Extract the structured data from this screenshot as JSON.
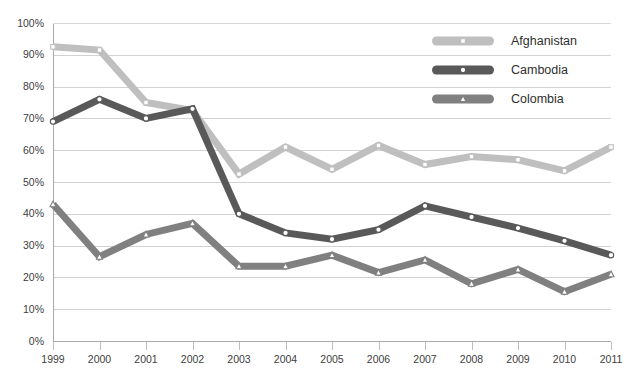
{
  "chart_data": {
    "type": "line",
    "title": "",
    "subtitle": "",
    "xlabel": "",
    "ylabel": "",
    "x": [
      "1999",
      "2000",
      "2001",
      "2002",
      "2003",
      "2004",
      "2005",
      "2006",
      "2007",
      "2008",
      "2009",
      "2010",
      "2011"
    ],
    "categories": [
      "1999",
      "2000",
      "2001",
      "2002",
      "2003",
      "2004",
      "2005",
      "2006",
      "2007",
      "2008",
      "2009",
      "2010",
      "2011"
    ],
    "ylim": [
      0,
      100
    ],
    "y_tick_labels": [
      "0%",
      "10%",
      "20%",
      "30%",
      "40%",
      "50%",
      "60%",
      "70%",
      "80%",
      "90%",
      "100%"
    ],
    "y_tick_values": [
      0,
      10,
      20,
      30,
      40,
      50,
      60,
      70,
      80,
      90,
      100
    ],
    "x_tick_labels": [
      "1999",
      "2000",
      "2001",
      "2002",
      "2003",
      "2004",
      "2005",
      "2006",
      "2007",
      "2008",
      "2009",
      "2010",
      "2011"
    ],
    "grid": "horizontal",
    "legend_position": "top-right",
    "units": "percent",
    "series": [
      {
        "name": "Afghanistan",
        "color": "#bfbfbf",
        "marker": "square",
        "marker_fill": "#ffffff",
        "values": [
          92.5,
          91.5,
          75,
          72.5,
          52.5,
          61,
          54,
          61.5,
          55.5,
          58,
          57,
          53.5,
          61
        ]
      },
      {
        "name": "Cambodia",
        "color": "#595959",
        "marker": "circle",
        "marker_fill": "#ffffff",
        "values": [
          69,
          76,
          70,
          73,
          40,
          34,
          32,
          35,
          42.5,
          39,
          35.5,
          31.5,
          27
        ]
      },
      {
        "name": "Colombia",
        "color": "#808080",
        "marker": "triangle",
        "marker_fill": "#ffffff",
        "values": [
          43,
          26.5,
          33.5,
          37,
          23.5,
          23.5,
          27,
          21.5,
          25.5,
          18,
          22.5,
          15.5,
          21
        ]
      }
    ]
  },
  "legend": {
    "entries": [
      {
        "label": "Afghanistan"
      },
      {
        "label": "Cambodia"
      },
      {
        "label": "Colombia"
      }
    ]
  }
}
